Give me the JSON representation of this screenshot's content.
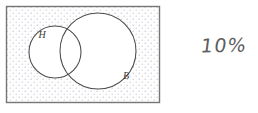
{
  "figure": {
    "type": "venn-diagram",
    "universe_label": "",
    "background_color": "#ffffff"
  },
  "universal_set_box": {
    "name": "universal-set-rectangle",
    "x": 6,
    "y": 6,
    "width": 154,
    "height": 97,
    "border_color": "#6f6f6f",
    "fill_description": "stipple-dot-shading",
    "stipple_color": "#b9b9c9",
    "shaded": true
  },
  "sets": [
    {
      "id": "H",
      "label": "H",
      "name": "circle-h",
      "cx": 55,
      "cy": 52,
      "r": 26,
      "stroke_color": "#4a4a4a",
      "fill_color": "#ffffff",
      "label_x": 42,
      "label_y": 38
    },
    {
      "id": "B",
      "label": "B",
      "name": "circle-b",
      "cx": 98,
      "cy": 51,
      "r": 38,
      "stroke_color": "#4a4a4a",
      "fill_color": "#ffffff",
      "label_x": 126,
      "label_y": 79
    }
  ],
  "annotations": [
    {
      "name": "percentage-annotation",
      "text": "10%",
      "x": 201,
      "y": 36,
      "color": "#5d5d5d",
      "style": "handwritten"
    }
  ]
}
